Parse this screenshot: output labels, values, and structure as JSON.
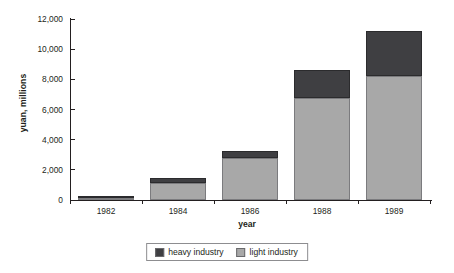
{
  "chart_data": {
    "type": "bar",
    "title": "",
    "subtitle": "",
    "stacked": true,
    "xlabel": "year",
    "ylabel": "yuan, millions",
    "categories": [
      "1982",
      "1984",
      "1986",
      "1988",
      "1989"
    ],
    "series": [
      {
        "name": "light industry",
        "color": "#a8a8a8",
        "values": [
          150,
          1130,
          2780,
          6750,
          8200
        ]
      },
      {
        "name": "heavy industry",
        "color": "#3f3f42",
        "values": [
          150,
          320,
          470,
          1850,
          3000
        ]
      }
    ],
    "totals": [
      300,
      1450,
      3250,
      8600,
      11200
    ],
    "ylim": [
      0,
      12000
    ],
    "ytick_values": [
      0,
      2000,
      4000,
      6000,
      8000,
      10000,
      12000
    ],
    "ytick_labels": [
      "0",
      "2,000",
      "4,000",
      "6,000",
      "8,000",
      "10,000",
      "12,000"
    ],
    "grid": false,
    "legend_position": "bottom-center",
    "legend_entries": [
      {
        "label": "heavy industry",
        "color": "#3f3f42"
      },
      {
        "label": "light industry",
        "color": "#a8a8a8"
      }
    ]
  }
}
